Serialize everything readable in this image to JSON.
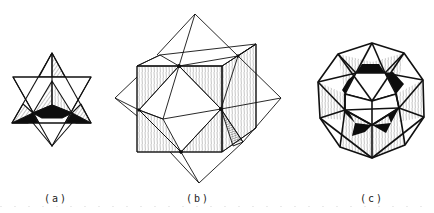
{
  "figures": [
    {
      "id": "a",
      "label": "(a)",
      "description": "stellated octahedron (star tetrahedron)"
    },
    {
      "id": "b",
      "label": "(b)",
      "description": "cube-octahedron compound"
    },
    {
      "id": "c",
      "label": "(c)",
      "description": "icosahedron-dodecahedron compound / stellated polyhedron"
    }
  ],
  "colors": {
    "line": "#111111",
    "fill_dark": "#0d0d0d",
    "hatch": "#777777",
    "background": "#ffffff"
  }
}
